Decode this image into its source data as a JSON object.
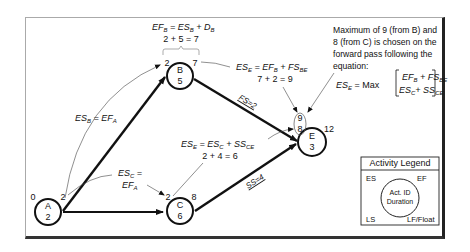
{
  "nodes": [
    {
      "id": "A",
      "duration": "2",
      "es": "0",
      "ef": "2"
    },
    {
      "id": "B",
      "duration": "5",
      "es": "2",
      "ef": "7"
    },
    {
      "id": "C",
      "duration": "6",
      "es": "2",
      "ef": "8"
    },
    {
      "id": "E",
      "duration": "3",
      "es_candidates": [
        "9",
        "8"
      ],
      "ef": "12"
    }
  ],
  "links": [
    {
      "from": "A",
      "to": "B",
      "label": ""
    },
    {
      "from": "A",
      "to": "C",
      "label": ""
    },
    {
      "from": "B",
      "to": "E",
      "label": "FS=2"
    },
    {
      "from": "C",
      "to": "E",
      "label": "SS=4"
    }
  ],
  "annotations": {
    "ef_b": {
      "lhs": "EF",
      "lhs_sub": "B",
      "eq": " = ES",
      "rhs_sub": "B",
      "plus": " + D",
      "plus_sub": "B",
      "calc": "2 + 5 = 7"
    },
    "es_b": {
      "lhs": "ES",
      "lhs_sub": "B",
      "eq": " = EF",
      "rhs_sub": "A"
    },
    "es_c": {
      "line1": "ES",
      "line1_sub": "C",
      "line1_eq": " =",
      "line2": "EF",
      "line2_sub": "A"
    },
    "es_e_b": {
      "lhs": "ES",
      "lhs_sub": "E",
      "eq": " = EF",
      "rhs_sub": "B",
      "plus": " + FS",
      "plus_sub": "BE",
      "calc": "7 + 2 = 9"
    },
    "es_e_c": {
      "lhs": "ES",
      "lhs_sub": "E",
      "eq": " = ES",
      "rhs_sub": "C",
      "plus": " + SS",
      "plus_sub": "CE",
      "calc": "2 + 4 = 6"
    },
    "max_note": {
      "lines": [
        "Maximum of 9 (from B) and",
        "8 (from C) is chosen on the",
        "forward pass following the",
        "equation:"
      ],
      "eq_lhs": "ES",
      "eq_lhs_sub": "E",
      "eq_mid": " = Max",
      "row1": "EF",
      "row1_sub": "B",
      "row1_plus": " + FS",
      "row1_plus_sub": "BE",
      "row2": "ES",
      "row2_sub": "C",
      "row2_plus": "+ SS",
      "row2_plus_sub": "CE"
    }
  },
  "legend": {
    "title": "Activity Legend",
    "es": "ES",
    "ef": "EF",
    "ls": "LS",
    "lf": "LF/Float",
    "center_line1": "Act. ID",
    "center_line2": "Duration"
  }
}
